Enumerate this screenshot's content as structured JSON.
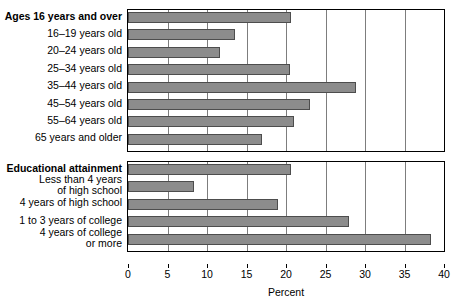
{
  "chart_data": {
    "type": "bar",
    "orientation": "horizontal",
    "title": "",
    "xlabel": "Percent",
    "ylabel": "",
    "xlim": [
      0,
      40
    ],
    "xticks": [
      0,
      5,
      10,
      15,
      20,
      25,
      30,
      35,
      40
    ],
    "xtick_labels": [
      "0",
      "5",
      "10",
      "15",
      "20",
      "25",
      "30",
      "35",
      "40"
    ],
    "grid": true,
    "legend": "none",
    "panels": [
      {
        "heading": "Ages 16 years and over",
        "heading_bold": true,
        "categories": [
          "Ages 16 years and over",
          "16–19 years old",
          "20–24 years old",
          "25–34 years old",
          "35–44 years old",
          "45–54 years old",
          "55–64 years old",
          "65 years and older"
        ],
        "values": [
          20.6,
          13.6,
          11.6,
          20.5,
          28.8,
          23.0,
          21.0,
          17.0
        ]
      },
      {
        "heading": "Educational attainment",
        "heading_bold": true,
        "categories": [
          "Educational attainment",
          "Less than 4 years\nof high school",
          "4 years of high school",
          "1 to 3 years of college",
          "4 years of college\nor more"
        ],
        "values": [
          20.6,
          8.3,
          19.0,
          28.0,
          38.3
        ]
      }
    ],
    "colors": {
      "bar_fill": "#8c8c8c",
      "bar_edge": "#4d4d4d",
      "gridline": "#7d7d7d",
      "axis": "#000000",
      "background": "#ffffff",
      "text": "#000000"
    }
  }
}
